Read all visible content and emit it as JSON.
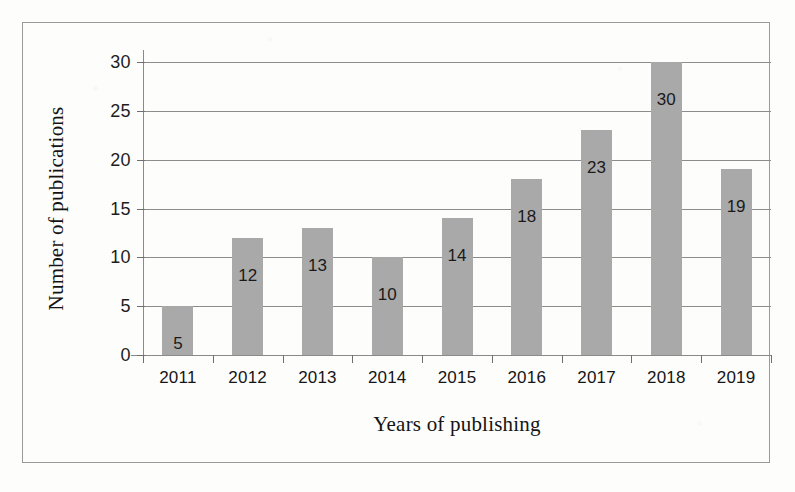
{
  "chart_data": {
    "type": "bar",
    "title": "",
    "xlabel": "Years of publishing",
    "ylabel": "Number of publications",
    "categories": [
      "2011",
      "2012",
      "2013",
      "2014",
      "2015",
      "2016",
      "2017",
      "2018",
      "2019"
    ],
    "values": [
      5,
      12,
      13,
      10,
      14,
      18,
      23,
      30,
      19
    ],
    "data_labels": [
      "5",
      "12",
      "13",
      "10",
      "14",
      "18",
      "23",
      "30",
      "19"
    ],
    "ylim": [
      0,
      30
    ],
    "ytick_labels": [
      "0",
      "5",
      "10",
      "15",
      "20",
      "25",
      "30"
    ],
    "ytick_values": [
      0,
      5,
      10,
      15,
      20,
      25,
      30
    ],
    "grid": "horizontal",
    "legend": "none",
    "bar_color": "#a9a9a9",
    "axis_color": "#8a8a8a",
    "gridline_color": "#8c8c8c",
    "text_color": "#151515",
    "background_color": "#fdfdfc",
    "frame_color": "#9a9a9a"
  }
}
